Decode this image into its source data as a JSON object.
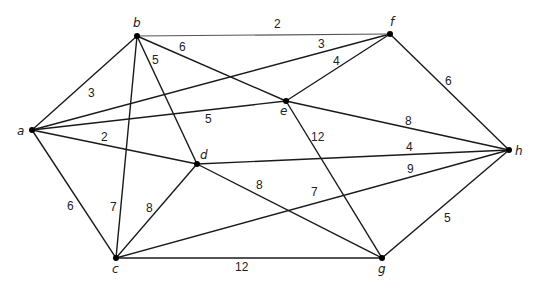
{
  "nodes": [
    {
      "id": "a",
      "label": "a",
      "x": 32,
      "y": 130,
      "lx": 17,
      "ly": 135
    },
    {
      "id": "b",
      "label": "b",
      "x": 137,
      "y": 36,
      "lx": 133,
      "ly": 27
    },
    {
      "id": "c",
      "label": "c",
      "x": 116,
      "y": 258,
      "lx": 112,
      "ly": 273
    },
    {
      "id": "d",
      "label": "d",
      "x": 197,
      "y": 164,
      "lx": 200,
      "ly": 159
    },
    {
      "id": "e",
      "label": "e",
      "x": 286,
      "y": 101,
      "lx": 280,
      "ly": 115
    },
    {
      "id": "f",
      "label": "f",
      "x": 390,
      "y": 34,
      "lx": 390,
      "ly": 26
    },
    {
      "id": "g",
      "label": "g",
      "x": 382,
      "y": 258,
      "lx": 378,
      "ly": 273
    },
    {
      "id": "h",
      "label": "h",
      "x": 509,
      "y": 150,
      "lx": 515,
      "ly": 155
    }
  ],
  "edges": [
    {
      "from": "a",
      "to": "b",
      "weight": "3",
      "wx": 88,
      "wy": 97
    },
    {
      "from": "a",
      "to": "f",
      "weight": "3",
      "wx": 318,
      "wy": 48
    },
    {
      "from": "a",
      "to": "e",
      "weight": "5",
      "wx": 205,
      "wy": 123
    },
    {
      "from": "a",
      "to": "d",
      "weight": "2",
      "wx": 101,
      "wy": 141
    },
    {
      "from": "a",
      "to": "c",
      "weight": "6",
      "wx": 67,
      "wy": 210
    },
    {
      "from": "b",
      "to": "f",
      "weight": "2",
      "wx": 274,
      "wy": 28,
      "thin": true
    },
    {
      "from": "b",
      "to": "e",
      "weight": "6",
      "wx": 179,
      "wy": 51
    },
    {
      "from": "b",
      "to": "d",
      "weight": "5",
      "wx": 152,
      "wy": 64
    },
    {
      "from": "b",
      "to": "c",
      "weight": "7",
      "wx": 110,
      "wy": 211
    },
    {
      "from": "e",
      "to": "f",
      "weight": "4",
      "wx": 333,
      "wy": 65
    },
    {
      "from": "e",
      "to": "h",
      "weight": "8",
      "wx": 405,
      "wy": 125
    },
    {
      "from": "e",
      "to": "g",
      "weight": "12",
      "wx": 311,
      "wy": 141
    },
    {
      "from": "f",
      "to": "h",
      "weight": "6",
      "wx": 445,
      "wy": 85
    },
    {
      "from": "d",
      "to": "h",
      "weight": "4",
      "wx": 406,
      "wy": 151
    },
    {
      "from": "d",
      "to": "g",
      "weight": "8",
      "wx": 256,
      "wy": 189
    },
    {
      "from": "c",
      "to": "d",
      "weight": "8",
      "wx": 146,
      "wy": 212
    },
    {
      "from": "c",
      "to": "h",
      "weight": "9",
      "wx": 407,
      "wy": 173
    },
    {
      "from": "c",
      "to": "g",
      "weight": "12",
      "wx": 235,
      "wy": 271
    },
    {
      "from": "g",
      "to": "h",
      "weight": "5",
      "wx": 444,
      "wy": 222
    }
  ],
  "extra_labels": [
    {
      "text": "7",
      "x": 311,
      "y": 196
    }
  ]
}
